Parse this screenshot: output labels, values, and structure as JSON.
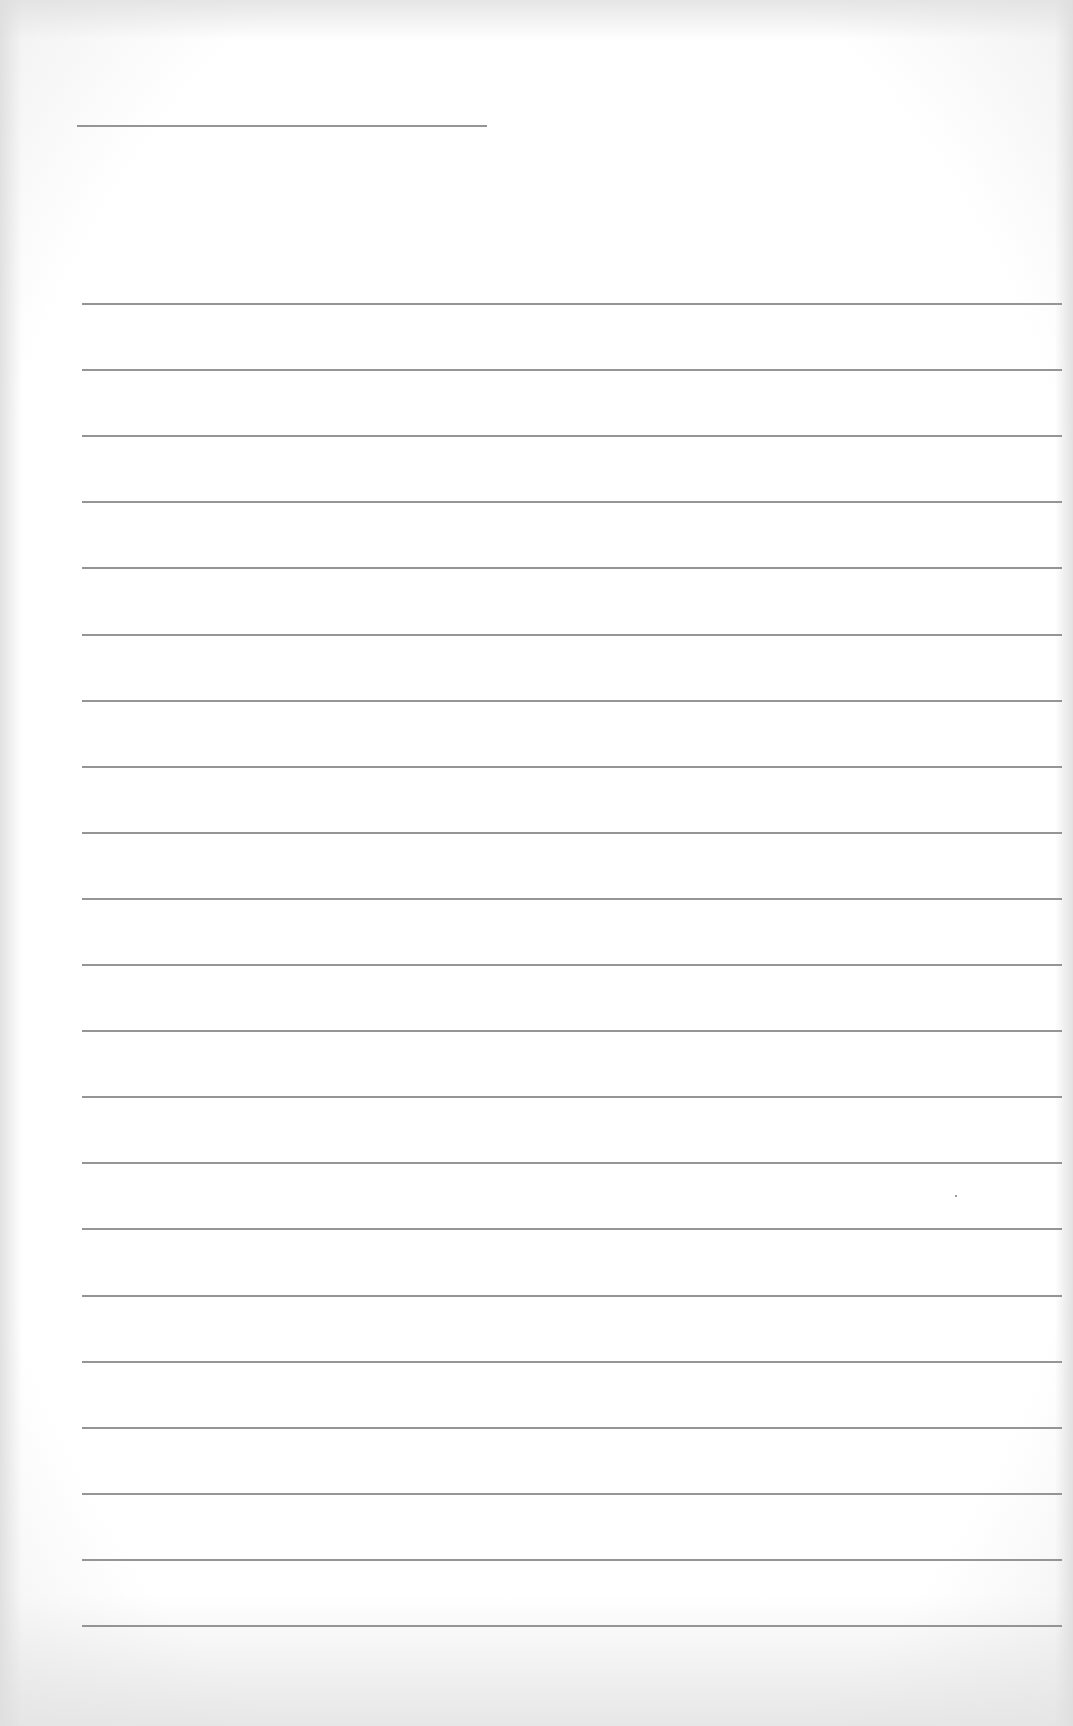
{
  "sheet": {
    "type": "lined-paper",
    "width": 1073,
    "height": 1726,
    "paper_color": "#ffffff",
    "line_color": "#8a8a8a",
    "header_line": {
      "x1": 77,
      "x2": 487,
      "y": 125
    },
    "ruled_lines": {
      "count": 21,
      "x1": 82,
      "x2": 1062,
      "first_y": 303,
      "spacing": 66.1
    },
    "speck": {
      "x": 955,
      "y": 1195
    }
  }
}
